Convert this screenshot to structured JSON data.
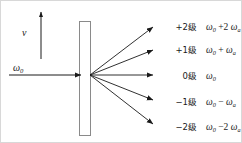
{
  "figure": {
    "title": "",
    "cell": {
      "name": "acousto-optic-cell",
      "fill": "#ffffff",
      "stroke": "#8a8a8a"
    },
    "colors": {
      "line": "#1a1a1a",
      "cell_stroke": "#8a8a8a",
      "background": "#ffffff",
      "border": "#d8d8d8"
    },
    "velocity": {
      "symbol": "v",
      "arrow_direction": "up"
    },
    "incident": {
      "symbol": "ω",
      "subscript": "0",
      "arrow_direction": "right"
    },
    "orders": [
      {
        "order_label": "+2级",
        "frequency": "ω₀ +2 ωₐ",
        "freq_main": "ω",
        "freq_main_sub": "0",
        "freq_op": "+2",
        "freq_term": "ω",
        "freq_term_sub": "a",
        "end_x": 156,
        "end_y": 23
      },
      {
        "order_label": "+1级",
        "frequency": "ω₀ + ωₐ",
        "freq_main": "ω",
        "freq_main_sub": "0",
        "freq_op": "+",
        "freq_term": "ω",
        "freq_term_sub": "a",
        "end_x": 156,
        "end_y": 47
      },
      {
        "order_label": "0级",
        "frequency": "ω₀",
        "freq_main": "ω",
        "freq_main_sub": "0",
        "freq_op": "",
        "freq_term": "",
        "freq_term_sub": "",
        "end_x": 157,
        "end_y": 74
      },
      {
        "order_label": "−1级",
        "frequency": "ω₀ − ωₐ",
        "freq_main": "ω",
        "freq_main_sub": "0",
        "freq_op": "−",
        "freq_term": "ω",
        "freq_term_sub": "a",
        "end_x": 156,
        "end_y": 100
      },
      {
        "order_label": "−2级",
        "frequency": "ω₀ −2 ωₐ",
        "freq_main": "ω",
        "freq_main_sub": "0",
        "freq_op": "−2",
        "freq_term": "ω",
        "freq_term_sub": "a",
        "end_x": 156,
        "end_y": 126
      }
    ]
  }
}
